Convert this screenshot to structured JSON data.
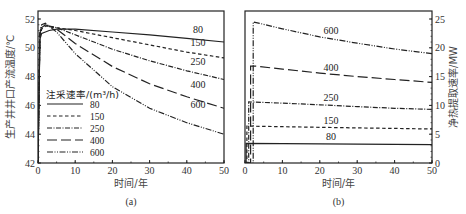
{
  "chart_data": [
    {
      "type": "line",
      "panel": "(a)",
      "caption": "(a)",
      "title": "",
      "xlabel": "时间/年",
      "ylabel": "生产井井口产流温度/℃",
      "xlim": [
        0,
        50
      ],
      "ylim": [
        42,
        52
      ],
      "xticks": [
        0,
        10,
        20,
        30,
        40,
        50
      ],
      "yticks": [
        42,
        44,
        46,
        48,
        50,
        52
      ],
      "grid": false,
      "legend": {
        "title": "注采速率/(m³/h)",
        "position": "lower left",
        "entries": [
          "80",
          "150",
          "250",
          "400",
          "600"
        ]
      },
      "series": [
        {
          "name": "80",
          "style": "solid",
          "x": [
            0,
            0.5,
            1,
            2,
            3,
            5,
            10,
            20,
            30,
            40,
            50
          ],
          "values": [
            42,
            50.6,
            51.0,
            51.1,
            51.2,
            51.3,
            51.3,
            51.1,
            50.9,
            50.65,
            50.4
          ]
        },
        {
          "name": "150",
          "style": "dashed",
          "x": [
            0,
            0.5,
            1,
            2,
            3,
            5,
            10,
            20,
            30,
            40,
            50
          ],
          "values": [
            42,
            50.8,
            51.3,
            51.5,
            51.5,
            51.4,
            51.2,
            50.7,
            50.2,
            49.7,
            49.3
          ]
        },
        {
          "name": "250",
          "style": "dashdot",
          "x": [
            0,
            0.5,
            1,
            2,
            3,
            5,
            10,
            20,
            30,
            40,
            50
          ],
          "values": [
            42,
            50.9,
            51.4,
            51.6,
            51.5,
            51.4,
            50.9,
            49.9,
            49.1,
            48.4,
            47.8
          ]
        },
        {
          "name": "400",
          "style": "longdash",
          "x": [
            0,
            0.5,
            1,
            2,
            3,
            5,
            10,
            20,
            30,
            40,
            50
          ],
          "values": [
            42,
            51.0,
            51.5,
            51.6,
            51.5,
            51.3,
            50.3,
            48.7,
            47.5,
            46.6,
            45.8
          ]
        },
        {
          "name": "600",
          "style": "dashdotdot",
          "x": [
            0,
            0.5,
            1,
            2,
            3,
            5,
            10,
            20,
            30,
            40,
            50
          ],
          "values": [
            42,
            51.1,
            51.6,
            51.7,
            51.5,
            51.1,
            49.6,
            47.3,
            45.8,
            44.8,
            44.0
          ]
        }
      ],
      "annotations": [
        {
          "text": "80",
          "x": 43,
          "y": 51.0
        },
        {
          "text": "150",
          "x": 43,
          "y": 50.1
        },
        {
          "text": "250",
          "x": 43,
          "y": 48.8
        },
        {
          "text": "400",
          "x": 43,
          "y": 47.2
        },
        {
          "text": "600",
          "x": 43,
          "y": 45.8
        }
      ]
    },
    {
      "type": "line",
      "panel": "(b)",
      "caption": "(b)",
      "title": "",
      "xlabel": "时间/年",
      "ylabel": "净热提取速率/MW",
      "xlim": [
        0,
        50
      ],
      "ylim": [
        0,
        26
      ],
      "xticks": [
        0,
        10,
        20,
        30,
        40,
        50
      ],
      "yticks": [
        0,
        5,
        10,
        15,
        20,
        25
      ],
      "yaxis_position": "right",
      "grid": false,
      "series": [
        {
          "name": "80",
          "style": "solid",
          "x": [
            0,
            0.3,
            0.3,
            50
          ],
          "values": [
            0,
            0,
            3.4,
            3.2
          ]
        },
        {
          "name": "150",
          "style": "dashed",
          "x": [
            0,
            0.5,
            0.5,
            10,
            20,
            30,
            40,
            50
          ],
          "values": [
            0,
            0,
            6.4,
            6.3,
            6.2,
            6.1,
            6.0,
            5.9
          ]
        },
        {
          "name": "250",
          "style": "dashdot",
          "x": [
            0,
            1.0,
            1.0,
            10,
            20,
            30,
            40,
            50
          ],
          "values": [
            0,
            0,
            10.6,
            10.4,
            10.1,
            9.8,
            9.5,
            9.3
          ]
        },
        {
          "name": "400",
          "style": "longdash",
          "x": [
            0,
            1.5,
            1.5,
            3,
            10,
            20,
            30,
            40,
            50
          ],
          "values": [
            0,
            0,
            16.8,
            16.8,
            16.3,
            15.6,
            15.0,
            14.5,
            14.0
          ]
        },
        {
          "name": "600",
          "style": "dashdotdot",
          "x": [
            0,
            2.2,
            2.2,
            10,
            20,
            30,
            40,
            50
          ],
          "values": [
            0,
            0,
            24.5,
            23.3,
            21.9,
            20.8,
            19.8,
            19.0
          ]
        }
      ],
      "annotations": [
        {
          "text": "600",
          "x": 23,
          "y": 22.4
        },
        {
          "text": "400",
          "x": 23,
          "y": 15.9
        },
        {
          "text": "250",
          "x": 23,
          "y": 10.8
        },
        {
          "text": "150",
          "x": 23,
          "y": 6.8
        },
        {
          "text": "80",
          "x": 23,
          "y": 4.0
        }
      ]
    }
  ]
}
